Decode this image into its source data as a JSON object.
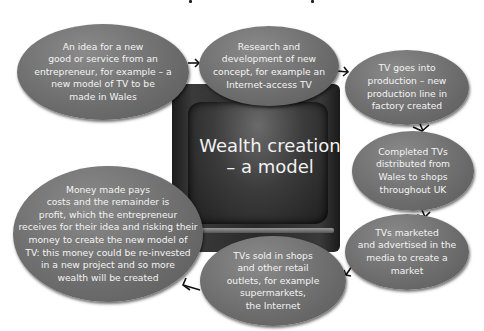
{
  "diagram": {
    "title": "Wealth creation\n– a model",
    "colors": {
      "bubble": "#6e6e6e",
      "bubble_text": "#f4f4f4",
      "tv_body": "#2a2a2a",
      "arrow": "#111111"
    },
    "steps": [
      {
        "id": 1,
        "text": "An idea for a new\ngood or service from an\nentrepreneur, for example – a\nnew model of TV to be\nmade in Wales"
      },
      {
        "id": 2,
        "text": "Research and\ndevelopment of new\nconcept, for example an\nInternet-access TV"
      },
      {
        "id": 3,
        "text": "TV goes into\nproduction – new\nproduction line in\nfactory created"
      },
      {
        "id": 4,
        "text": "Completed TVs\ndistributed from\nWales to shops\nthroughout UK"
      },
      {
        "id": 5,
        "text": "TVs marketed\nand advertised in the\nmedia to create a\nmarket"
      },
      {
        "id": 6,
        "text": "TVs sold in shops\nand other retail\noutlets, for example\nsupermarkets,\nthe Internet"
      },
      {
        "id": 7,
        "text": "Money made pays\ncosts and the remainder is\nprofit, which the entrepreneur\nreceives for their idea and risking their\nmoney to create the new model of\nTV: this money could be re-invested\nin a new project and so more\nwealth will be created"
      }
    ],
    "flow": [
      "1→2",
      "2→3",
      "3→4",
      "4→5",
      "5→6",
      "6→7"
    ]
  }
}
